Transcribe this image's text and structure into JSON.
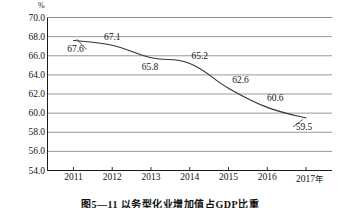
{
  "chart_data": {
    "type": "line",
    "title": "",
    "caption": "图5—11  以务型化业增加值占GDP比重",
    "unit_label": "%",
    "xlabel": "",
    "ylabel": "",
    "categories": [
      "2011",
      "2012",
      "2013",
      "2014",
      "2015",
      "2016",
      "2017"
    ],
    "x_axis_suffix": "年",
    "values": [
      67.6,
      67.1,
      65.8,
      65.2,
      62.6,
      60.6,
      59.5
    ],
    "point_labels": [
      "67.6",
      "67.1",
      "65.8",
      "65.2",
      "62.6",
      "60.6",
      "59.5"
    ],
    "ylim": [
      54.0,
      70.0
    ],
    "ytick_step": 2.0,
    "ytick_labels": [
      "70.0",
      "68.0",
      "66.0",
      "64.0",
      "62.0",
      "60.0",
      "58.0",
      "56.0",
      "54.0"
    ],
    "ytick_values": [
      70.0,
      68.0,
      66.0,
      64.0,
      62.0,
      60.0,
      58.0,
      56.0,
      54.0
    ],
    "grid": true,
    "legend": "none",
    "colors": {
      "line": "#333333",
      "grid": "#8c8c8c",
      "axis": "#1a1a1a",
      "text": "#141414",
      "background": "#ffffff"
    }
  },
  "label_offsets": [
    {
      "dx": 2,
      "dy": 9
    },
    {
      "dx": 0,
      "dy": -8
    },
    {
      "dx": -1,
      "dy": 9
    },
    {
      "dx": 10,
      "dy": -7
    },
    {
      "dx": 12,
      "dy": -8
    },
    {
      "dx": 8,
      "dy": -9
    },
    {
      "dx": -2,
      "dy": 9
    }
  ]
}
